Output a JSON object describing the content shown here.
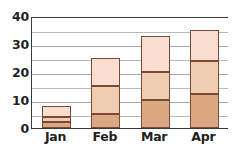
{
  "chart_data": {
    "type": "bar",
    "stacked": true,
    "title": "",
    "subtitle": "",
    "xlabel": "",
    "ylabel": "",
    "categories": [
      "Jan",
      "Feb",
      "Mar",
      "Apr"
    ],
    "series": [
      {
        "name": "Series 1",
        "values": [
          2,
          5,
          10,
          12
        ],
        "color": "#dba883"
      },
      {
        "name": "Series 2",
        "values": [
          2,
          10,
          10,
          12
        ],
        "color": "#f0cdb0"
      },
      {
        "name": "Series 3",
        "values": [
          4,
          10,
          13,
          11
        ],
        "color": "#f9ded0"
      }
    ],
    "cumulative_tops": [
      [
        2,
        4,
        8
      ],
      [
        5,
        15,
        25
      ],
      [
        10,
        20,
        33
      ],
      [
        12,
        24,
        35
      ]
    ],
    "totals": [
      8,
      25,
      33,
      35
    ],
    "ylim": [
      0,
      40
    ],
    "ytick_labels": [
      "0",
      "10",
      "20",
      "30",
      "40"
    ],
    "ytick_values": [
      0,
      10,
      20,
      30,
      40
    ],
    "gridline_values": [
      5,
      10,
      15,
      20,
      25,
      30,
      35,
      40
    ],
    "grid": true,
    "legend": false,
    "legend_position": "none",
    "bar_border_color": "#7a4a35",
    "axis_color": "#3b3b3b",
    "gridline_color": "#b9b9b9",
    "background": "#ffffff"
  }
}
